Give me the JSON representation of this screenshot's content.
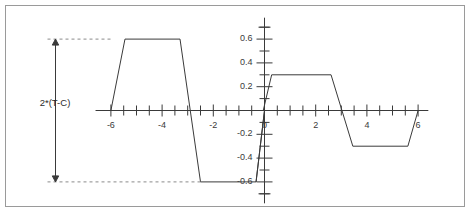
{
  "figure": {
    "title": "",
    "annotation_label": "2*(T-C)",
    "frame_color": "#9a9a9a",
    "line_color": "#3a3a3a",
    "dash_color": "#8a8a8a",
    "background": "#ffffff"
  },
  "chart_data": {
    "type": "line",
    "title": "",
    "xlabel": "",
    "ylabel": "",
    "xlim": [
      -6.6,
      6.4
    ],
    "ylim": [
      -0.75,
      0.75
    ],
    "grid": false,
    "legend": null,
    "x_ticks_major": [
      -6,
      -4,
      -2,
      0,
      2,
      4,
      6
    ],
    "x_tick_labels": [
      "-6",
      "-4",
      "-2",
      "0",
      "2",
      "4",
      "6"
    ],
    "x_tick_step_minor": 0.5,
    "y_ticks_major": [
      0.6,
      0.4,
      0.2,
      -0.2,
      -0.4,
      -0.6
    ],
    "y_tick_labels": [
      "0.6",
      "0.4",
      "0.2",
      "-0.2",
      "-0.4",
      "-0.6"
    ],
    "y_tick_step_minor": 0.1,
    "series": [
      {
        "name": "left-trapezoid-wave",
        "amplitude": 0.6,
        "points": [
          [
            -6.0,
            0.0
          ],
          [
            -5.45,
            0.6
          ],
          [
            -3.3,
            0.6
          ],
          [
            -2.5,
            -0.6
          ],
          [
            -0.33,
            -0.6
          ],
          [
            0.0,
            0.0
          ]
        ]
      },
      {
        "name": "right-trapezoid-wave",
        "amplitude": 0.3,
        "points": [
          [
            -0.33,
            -0.6
          ],
          [
            0.0,
            0.0
          ],
          [
            -0.05,
            0.0
          ],
          [
            0.28,
            0.3
          ],
          [
            2.6,
            0.3
          ],
          [
            3.45,
            -0.3
          ],
          [
            5.6,
            -0.3
          ],
          [
            6.0,
            0.0
          ]
        ]
      }
    ],
    "annotations": [
      {
        "name": "amplitude-dimension",
        "text": "2*(T-C)",
        "from_value": 0.6,
        "to_value": -0.6,
        "style": "double-headed-arrow-with-dashed-leaders"
      }
    ]
  }
}
